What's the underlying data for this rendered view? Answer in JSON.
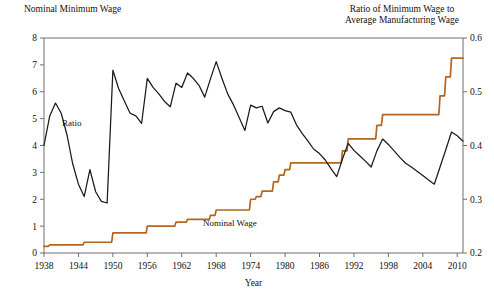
{
  "header": {
    "left_title": "Nominal Minimum Wage",
    "right_title_line1": "Ratio of Minimum Wage to",
    "right_title_line2": "Average Manufacturing Wage"
  },
  "labels": {
    "ratio_series": "Ratio",
    "nominal_series": "Nominal Wage",
    "xaxis_title": "Year"
  },
  "colors": {
    "nominal_wage": "#b5651d",
    "ratio": "#1a1a1a",
    "axis": "#6f6f6f"
  },
  "chart_data": {
    "type": "line",
    "title": "",
    "xlabel": "Year",
    "ylabel": "Nominal Minimum Wage",
    "y2label": "Ratio of Minimum Wage to Average Manufacturing Wage",
    "xlim": [
      1938,
      2011
    ],
    "ylim": [
      0,
      8
    ],
    "y2lim": [
      0.2,
      0.6
    ],
    "grid": false,
    "legend": "inline-annotations",
    "xticks": [
      1938,
      1944,
      1950,
      1956,
      1962,
      1968,
      1974,
      1980,
      1986,
      1992,
      1998,
      2004,
      2010
    ],
    "yticks": [
      0,
      1,
      2,
      3,
      4,
      5,
      6,
      7,
      8
    ],
    "y2ticks": [
      0.2,
      0.3,
      0.4,
      0.5,
      0.6
    ],
    "x": [
      1938,
      1939,
      1940,
      1941,
      1942,
      1943,
      1944,
      1945,
      1946,
      1947,
      1948,
      1949,
      1950,
      1951,
      1952,
      1953,
      1954,
      1955,
      1956,
      1957,
      1958,
      1959,
      1960,
      1961,
      1962,
      1963,
      1964,
      1965,
      1966,
      1967,
      1968,
      1969,
      1970,
      1971,
      1972,
      1973,
      1974,
      1975,
      1976,
      1977,
      1978,
      1979,
      1980,
      1981,
      1982,
      1983,
      1984,
      1985,
      1986,
      1987,
      1988,
      1989,
      1990,
      1991,
      1992,
      1993,
      1994,
      1995,
      1996,
      1997,
      1998,
      1999,
      2000,
      2001,
      2002,
      2003,
      2004,
      2005,
      2006,
      2007,
      2008,
      2009,
      2010,
      2011
    ],
    "series": [
      {
        "name": "Nominal Wage",
        "axis": "left",
        "unit": "dollars per hour",
        "color": "#b5651d",
        "values": [
          0.25,
          0.3,
          0.3,
          0.3,
          0.3,
          0.3,
          0.3,
          0.4,
          0.4,
          0.4,
          0.4,
          0.4,
          0.75,
          0.75,
          0.75,
          0.75,
          0.75,
          0.75,
          1.0,
          1.0,
          1.0,
          1.0,
          1.0,
          1.15,
          1.15,
          1.25,
          1.25,
          1.25,
          1.25,
          1.4,
          1.6,
          1.6,
          1.6,
          1.6,
          1.6,
          1.6,
          2.0,
          2.1,
          2.3,
          2.3,
          2.65,
          2.9,
          3.1,
          3.35,
          3.35,
          3.35,
          3.35,
          3.35,
          3.35,
          3.35,
          3.35,
          3.35,
          3.8,
          4.25,
          4.25,
          4.25,
          4.25,
          4.25,
          4.75,
          5.15,
          5.15,
          5.15,
          5.15,
          5.15,
          5.15,
          5.15,
          5.15,
          5.15,
          5.15,
          5.85,
          6.55,
          7.25,
          7.25,
          7.25
        ]
      },
      {
        "name": "Ratio",
        "axis": "right",
        "unit": "ratio",
        "color": "#1a1a1a",
        "values": [
          0.4,
          0.455,
          0.479,
          0.46,
          0.42,
          0.366,
          0.328,
          0.305,
          0.355,
          0.314,
          0.296,
          0.293,
          0.54,
          0.506,
          0.483,
          0.46,
          0.455,
          0.441,
          0.525,
          0.508,
          0.496,
          0.482,
          0.472,
          0.516,
          0.508,
          0.535,
          0.525,
          0.512,
          0.49,
          0.524,
          0.556,
          0.525,
          0.496,
          0.476,
          0.452,
          0.428,
          0.475,
          0.47,
          0.473,
          0.442,
          0.463,
          0.47,
          0.465,
          0.462,
          0.438,
          0.422,
          0.408,
          0.393,
          0.385,
          0.373,
          0.357,
          0.342,
          0.375,
          0.404,
          0.391,
          0.381,
          0.371,
          0.36,
          0.39,
          0.412,
          0.402,
          0.39,
          0.378,
          0.367,
          0.36,
          0.352,
          0.344,
          0.336,
          0.328,
          0.36,
          0.392,
          0.425,
          0.418,
          0.408
        ]
      }
    ]
  }
}
